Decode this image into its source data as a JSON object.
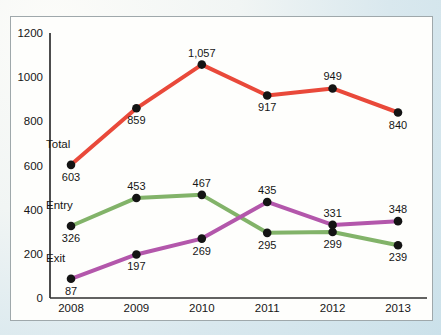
{
  "page": {
    "background_top_left_color": "#fbfcf9",
    "background_bottom_right_color": "#cbe1ea"
  },
  "panel": {
    "background": "#fefefc",
    "border_color": "#9fa8ab"
  },
  "chart_data": {
    "type": "line",
    "title": "",
    "xlabel": "",
    "ylabel": "",
    "categories": [
      "2008",
      "2009",
      "2010",
      "2011",
      "2012",
      "2013"
    ],
    "series": [
      {
        "name": "Total",
        "color": "#e9493a",
        "values": [
          603,
          859,
          1057,
          917,
          949,
          840
        ],
        "value_label_positions": [
          "below",
          "below",
          "above",
          "below",
          "above",
          "below"
        ]
      },
      {
        "name": "Entry",
        "color": "#82b369",
        "values": [
          326,
          453,
          467,
          295,
          299,
          239
        ],
        "value_label_positions": [
          "below",
          "above",
          "above",
          "below",
          "below",
          "below"
        ]
      },
      {
        "name": "Exit",
        "color": "#b357ab",
        "values": [
          87,
          197,
          269,
          435,
          331,
          348
        ],
        "value_label_positions": [
          "below",
          "below",
          "below",
          "above",
          "above",
          "above"
        ]
      }
    ],
    "ylim": [
      0,
      1200
    ],
    "yticks": [
      0,
      200,
      400,
      600,
      800,
      1000,
      1200
    ],
    "grid": false,
    "legend_position": "inline-left-of-first-points",
    "point_color": "#141414",
    "axis_color": "#2e2e2e",
    "text_color": "#161616"
  }
}
